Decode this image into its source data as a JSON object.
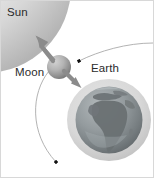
{
  "diagram": {
    "background_color": "#ffffff",
    "border_color": "#d8d8d8",
    "text_color": "#2b2b2b",
    "labels": {
      "sun": "Sun",
      "moon": "Moon",
      "earth": "Earth"
    },
    "bodies": [
      {
        "name": "sun",
        "label": "Sun",
        "shape": "circle",
        "center_x": -16,
        "center_y": -14,
        "radius": 86,
        "fill_light": "#ffffff",
        "fill_dark": "#b9b9b9",
        "note": "large partially off-canvas glowing sphere in upper-left"
      },
      {
        "name": "moon",
        "label": "Moon",
        "shape": "circle",
        "center_x": 58,
        "center_y": 66,
        "radius": 12,
        "fill_light": "#c9c9c9",
        "fill_dark": "#7c7c7c"
      },
      {
        "name": "earth",
        "label": "Earth",
        "shape": "circle",
        "center_x": 108,
        "center_y": 119,
        "radius": 34,
        "halo_radius": 42,
        "halo_color": "#cfcfcf",
        "ocean_color": "#8f9699",
        "land_color": "#6a7073",
        "note": "globe showing Africa and Europe landmasses with light grey atmosphere halo"
      }
    ],
    "orbit": {
      "name": "moon-orbit-path",
      "color": "#b0b0b0",
      "stroke_width": 1,
      "description": "thin curved arc representing the Moon's orbit around the Earth",
      "arrowheads": [
        {
          "name": "orbit-arrowhead-upper",
          "x": 72,
          "y": 60,
          "style": "square"
        },
        {
          "name": "orbit-arrowhead-lower",
          "x": 55,
          "y": 163,
          "style": "square"
        }
      ]
    },
    "vectors": [
      {
        "name": "moon-to-sun-arrow",
        "from_x": 56,
        "from_y": 58,
        "to_x": 38,
        "to_y": 38,
        "color": "#8c8c8c",
        "description": "thick grey arrow from the Moon pointing toward the Sun"
      },
      {
        "name": "moon-to-earth-arrow",
        "from_x": 64,
        "from_y": 72,
        "to_x": 80,
        "to_y": 86,
        "color": "#8c8c8c",
        "description": "thick grey arrow from the Moon pointing toward the Earth"
      }
    ]
  }
}
